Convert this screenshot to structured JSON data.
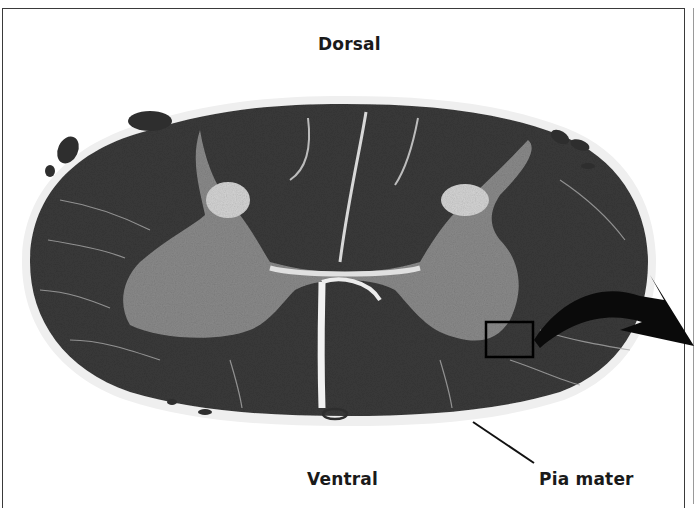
{
  "figure": {
    "labels": {
      "dorsal": "Dorsal",
      "ventral": "Ventral",
      "pia_mater": "Pia mater"
    },
    "annotations": {
      "inset_box": "highlighted region in ventral gray matter (right side)",
      "arrow": "curved arrow pointing right, out of frame",
      "leader_line": "line from pia mater label to cord surface"
    },
    "colors": {
      "white_matter": "#3c3c3c",
      "gray_matter": "#8c8c8c",
      "background": "#ffffff",
      "meninges": "#e6e6e6",
      "ink": "#000000"
    }
  }
}
